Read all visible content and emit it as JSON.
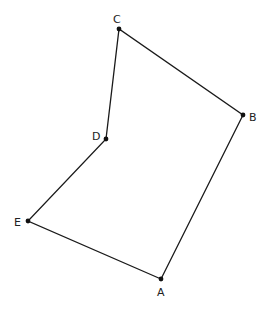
{
  "diagram": {
    "type": "polygon",
    "shape": "pentagon",
    "vertices": [
      {
        "id": "A",
        "label": "A",
        "x": 161,
        "y": 279,
        "label_x": 157,
        "label_y": 296
      },
      {
        "id": "B",
        "label": "B",
        "x": 243,
        "y": 115,
        "label_x": 249,
        "label_y": 121
      },
      {
        "id": "C",
        "label": "C",
        "x": 119,
        "y": 29,
        "label_x": 113,
        "label_y": 23
      },
      {
        "id": "D",
        "label": "D",
        "x": 106,
        "y": 139,
        "label_x": 92,
        "label_y": 140
      },
      {
        "id": "E",
        "label": "E",
        "x": 28,
        "y": 221,
        "label_x": 14,
        "label_y": 226
      }
    ],
    "edges": [
      [
        "A",
        "B"
      ],
      [
        "B",
        "C"
      ],
      [
        "C",
        "D"
      ],
      [
        "D",
        "E"
      ],
      [
        "E",
        "A"
      ]
    ],
    "colors": {
      "line": "#1a1a1a",
      "point": "#111111",
      "text": "#222222"
    }
  }
}
